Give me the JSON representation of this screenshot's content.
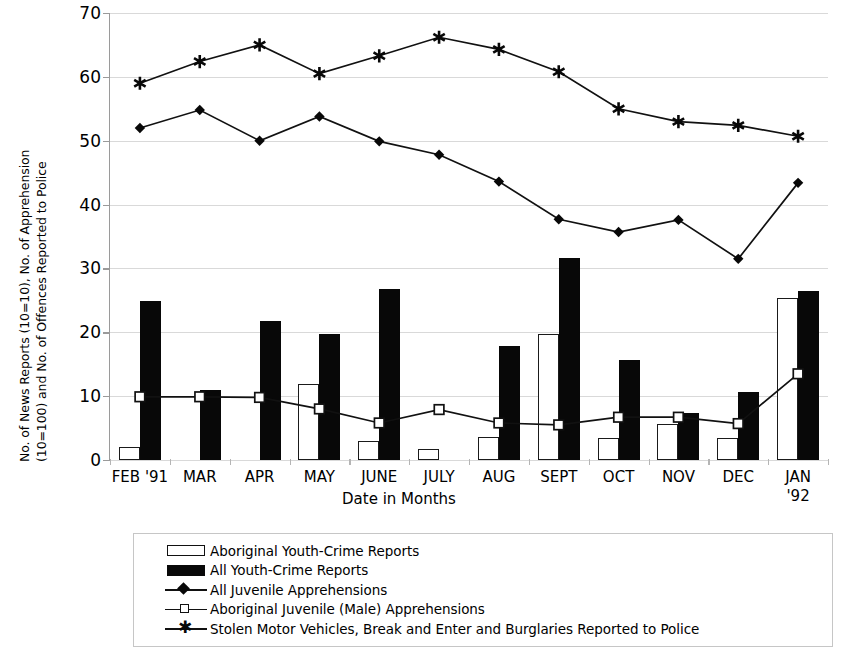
{
  "chart_data": {
    "type": "bar",
    "title": "",
    "xlabel": "Date in Months",
    "ylabel": "No. of News Reports (10=10), No. of Apprehension (10=100) and No. of Offences Reported to Police (10=1000)",
    "ylabel_line1": "No. of News Reports (10=10), No. of Apprehension",
    "ylabel_line2": "(10=100) and No. of Offences Reported to Police",
    "ylim": [
      0,
      70
    ],
    "yticks": [
      0,
      10,
      20,
      30,
      40,
      50,
      60,
      70
    ],
    "ytick_labels": [
      "0",
      "10",
      "20",
      "30",
      "40",
      "50",
      "60",
      "70"
    ],
    "grid": true,
    "legend_position": "bottom",
    "categories": [
      "FEB '91",
      "MAR",
      "APR",
      "MAY",
      "JUNE",
      "JULY",
      "AUG",
      "SEPT",
      "OCT",
      "NOV",
      "DEC",
      "JAN '92"
    ],
    "category_lines": [
      [
        "FEB '91"
      ],
      [
        "MAR"
      ],
      [
        "APR"
      ],
      [
        "MAY"
      ],
      [
        "JUNE"
      ],
      [
        "JULY"
      ],
      [
        "AUG"
      ],
      [
        "SEPT"
      ],
      [
        "OCT"
      ],
      [
        "NOV"
      ],
      [
        "DEC"
      ],
      [
        "JAN",
        "'92"
      ]
    ],
    "series": [
      {
        "name": "Aboriginal Youth-Crime Reports",
        "kind": "bar",
        "style": "open",
        "values": [
          2.0,
          0.0,
          0.0,
          11.9,
          2.9,
          1.7,
          3.6,
          19.7,
          3.5,
          5.6,
          3.4,
          25.4
        ]
      },
      {
        "name": "All Youth-Crime Reports",
        "kind": "bar",
        "style": "solid",
        "values": [
          24.9,
          11.0,
          21.8,
          19.8,
          26.8,
          0.0,
          17.8,
          31.7,
          15.6,
          7.4,
          10.6,
          26.5
        ]
      },
      {
        "name": "All Juvenile Apprehensions",
        "kind": "line",
        "marker": "diamond",
        "values": [
          52.0,
          54.8,
          50.0,
          53.8,
          49.9,
          47.8,
          43.6,
          37.7,
          35.7,
          37.6,
          31.5,
          43.4
        ]
      },
      {
        "name": "Aboriginal Juvenile (Male) Apprehensions",
        "kind": "line",
        "marker": "open-square",
        "values": [
          9.9,
          9.9,
          9.8,
          8.0,
          5.8,
          7.9,
          5.8,
          5.5,
          6.7,
          6.7,
          5.7,
          13.5
        ]
      },
      {
        "name": "Stolen Motor Vehicles, Break and Enter and Burglaries Reported to Police",
        "kind": "line",
        "marker": "star",
        "values": [
          59.0,
          62.4,
          65.0,
          60.5,
          63.3,
          66.2,
          64.3,
          60.8,
          55.0,
          53.0,
          52.4,
          50.7
        ]
      }
    ]
  },
  "legend": {
    "items": [
      {
        "label": "Aboriginal Youth-Crime Reports",
        "key": "open-rect-key"
      },
      {
        "label": "All Youth-Crime Reports",
        "key": "solid-rect-key"
      },
      {
        "label": "All Juvenile Apprehensions",
        "key": "line-diamond-key"
      },
      {
        "label": "Aboriginal Juvenile (Male) Apprehensions",
        "key": "line-open-square-key"
      },
      {
        "label": "Stolen Motor Vehicles, Break and Enter and Burglaries Reported to Police",
        "key": "line-star-key"
      }
    ]
  },
  "colors": {
    "solid_bar": "#080808",
    "open_bar_border": "#1a1a1a",
    "grid": "#d9d9d9",
    "axis": "#9a9a9a",
    "series_line": "#111111",
    "background": "#ffffff"
  }
}
